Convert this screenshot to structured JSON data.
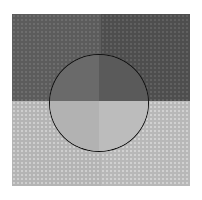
{
  "figure": {
    "colors": {
      "background": "#ffffff",
      "outer_top_left": "#5c5c5c",
      "outer_top_right": "#4e4e4e",
      "outer_bottom_left": "#b4b4b4",
      "outer_bottom_right": "#b8b8b8",
      "circle_top_left": "#6a6a6a",
      "circle_top_right": "#5a5a5a",
      "circle_bottom_left": "#b2b2b2",
      "circle_bottom_right": "#bcbcbc",
      "circle_outline": "#111111"
    }
  }
}
